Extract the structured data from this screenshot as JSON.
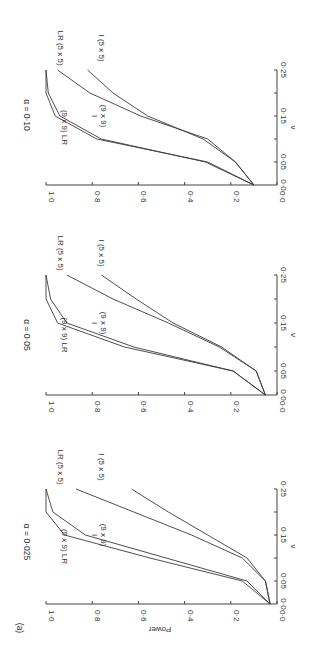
{
  "figure_label": "(a)",
  "power_axis_label": "Power",
  "nu_axis_label": "ν",
  "chart_data": [
    {
      "type": "line",
      "title": "α = 0·025",
      "xlabel": "ν",
      "ylabel": "Power",
      "x": [
        0,
        0.05,
        0.1,
        0.15,
        0.2,
        0.25
      ],
      "xticks": [
        "0·0",
        "0·05",
        "0·15",
        "0·25"
      ],
      "yticks": [
        "0·0",
        "0·2",
        "0·4",
        "0·6",
        "0·8",
        "1·0"
      ],
      "ylim": [
        0,
        1
      ],
      "xlim": [
        0,
        0.25
      ],
      "series": [
        {
          "name": "(9 x 9) LR",
          "values": [
            0.03,
            0.15,
            0.55,
            0.92,
            1.0,
            1.0
          ]
        },
        {
          "name": "I (9 x 9)",
          "values": [
            0.03,
            0.13,
            0.48,
            0.83,
            0.97,
            1.0
          ]
        },
        {
          "name": "LR (5 x 5)",
          "values": [
            0.03,
            0.05,
            0.15,
            0.37,
            0.62,
            0.87
          ]
        },
        {
          "name": "I (5 x 5)",
          "values": [
            0.03,
            0.05,
            0.13,
            0.3,
            0.47,
            0.63
          ]
        }
      ]
    },
    {
      "type": "line",
      "title": "α = 0·05",
      "xlabel": "ν",
      "ylabel": "Power",
      "x": [
        0,
        0.05,
        0.1,
        0.15,
        0.2,
        0.25
      ],
      "xticks": [
        "0·0",
        "0·05",
        "0·15",
        "0·25"
      ],
      "yticks": [
        "0·0",
        "0·2",
        "0·4",
        "0·6",
        "0·8",
        "1·0"
      ],
      "ylim": [
        0,
        1
      ],
      "xlim": [
        0,
        0.25
      ],
      "series": [
        {
          "name": "(9 x 9) LR",
          "values": [
            0.05,
            0.19,
            0.66,
            0.95,
            1.0,
            1.0
          ]
        },
        {
          "name": "I (9 x 9)",
          "values": [
            0.05,
            0.19,
            0.62,
            0.91,
            0.98,
            1.0
          ]
        },
        {
          "name": "LR (5 x 5)",
          "values": [
            0.05,
            0.09,
            0.25,
            0.47,
            0.71,
            0.91
          ]
        },
        {
          "name": "I (5 x 5)",
          "values": [
            0.05,
            0.09,
            0.24,
            0.45,
            0.61,
            0.76
          ]
        }
      ]
    },
    {
      "type": "line",
      "title": "α = 0·10",
      "xlabel": "ν",
      "ylabel": "Power",
      "x": [
        0,
        0.05,
        0.1,
        0.15,
        0.2,
        0.25
      ],
      "xticks": [
        "0·0",
        "0·05",
        "0·15",
        "0·25"
      ],
      "yticks": [
        "0·0",
        "0·2",
        "0·4",
        "0·6",
        "0·8",
        "1·0"
      ],
      "ylim": [
        0,
        1
      ],
      "xlim": [
        0,
        0.25
      ],
      "series": [
        {
          "name": "(9 x 9) LR",
          "values": [
            0.1,
            0.3,
            0.78,
            0.96,
            1.0,
            1.0
          ]
        },
        {
          "name": "I (9 x 9)",
          "values": [
            0.1,
            0.31,
            0.76,
            0.94,
            0.99,
            1.0
          ]
        },
        {
          "name": "LR (5 x 5)",
          "values": [
            0.1,
            0.18,
            0.3,
            0.59,
            0.81,
            0.95
          ]
        },
        {
          "name": "I (5 x 5)",
          "values": [
            0.1,
            0.18,
            0.32,
            0.56,
            0.71,
            0.82
          ]
        }
      ]
    }
  ],
  "panels": [
    {
      "title": "α = 0·025",
      "label_9lr": "(9 x 9) LR",
      "label_9i_top": "I",
      "label_9i_bottom": "(9 x 9)",
      "label_5lr": "LR (5 x 5)",
      "label_5i": "I (5 x 5)"
    },
    {
      "title": "α = 0·05",
      "label_9lr": "(9 x 9) LR",
      "label_9i_top": "I",
      "label_9i_bottom": "(9 x 9)",
      "label_5lr": "LR (5 x 5)",
      "label_5i": "I (5 x 5)"
    },
    {
      "title": "α = 0·10",
      "label_9lr": "(9 x 9) LR",
      "label_9i_top": "I",
      "label_9i_bottom": "(9 x 9)",
      "label_5lr": "LR (5 x 5)",
      "label_5i": "I (5 x 5)"
    }
  ]
}
